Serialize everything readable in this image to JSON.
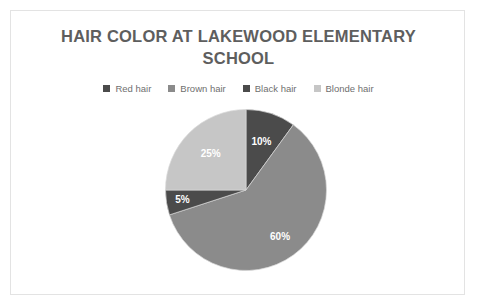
{
  "card": {
    "border_color": "#e3e3e3",
    "background": "#ffffff"
  },
  "chart_data": {
    "type": "pie",
    "title": "HAIR COLOR AT LAKEWOOD ELEMENTARY SCHOOL",
    "title_color": "#5e5e5e",
    "legend_position": "top",
    "start_angle_deg": 0,
    "direction": "clockwise",
    "labels_inside": true,
    "label_text_color": "#ffffff",
    "categories": [
      "Red hair",
      "Brown hair",
      "Black hair",
      "Blonde hair"
    ],
    "values": [
      10,
      60,
      5,
      25
    ],
    "value_labels": [
      "10%",
      "60%",
      "5%",
      "25%"
    ],
    "colors": [
      "#4b4b4b",
      "#8b8b8b",
      "#4b4b4b",
      "#c6c6c6"
    ],
    "slices": [
      {
        "label": "Red hair",
        "value": 10,
        "display": "10%",
        "color": "#4b4b4b"
      },
      {
        "label": "Brown hair",
        "value": 60,
        "display": "60%",
        "color": "#8b8b8b"
      },
      {
        "label": "Black hair",
        "value": 5,
        "display": "5%",
        "color": "#4b4b4b"
      },
      {
        "label": "Blonde hair",
        "value": 25,
        "display": "25%",
        "color": "#c6c6c6"
      }
    ],
    "xlabel": "",
    "ylabel": ""
  },
  "legend": {
    "items": [
      {
        "label": "Red hair",
        "color": "#4b4b4b"
      },
      {
        "label": "Brown hair",
        "color": "#8b8b8b"
      },
      {
        "label": "Black hair",
        "color": "#4b4b4b"
      },
      {
        "label": "Blonde hair",
        "color": "#c6c6c6"
      }
    ]
  }
}
